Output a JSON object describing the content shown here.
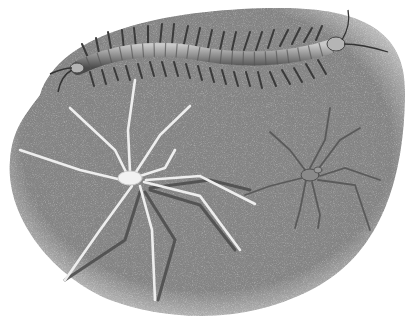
{
  "image": {
    "description": "Grayscale illustration of arthropods on a speckled gray ground",
    "background_color": "#ffffff",
    "ground_color": "#8c8c8c",
    "subjects": [
      {
        "name": "centipede",
        "color": "#9a9a9a"
      },
      {
        "name": "pale-spider",
        "color": "#e8e8e8"
      },
      {
        "name": "dark-spider",
        "color": "#6e6e6e"
      }
    ]
  }
}
